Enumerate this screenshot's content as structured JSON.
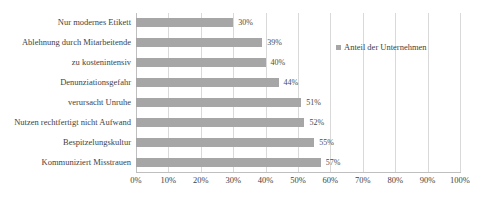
{
  "chart_data": {
    "type": "bar",
    "orientation": "horizontal",
    "title": "",
    "xlabel": "",
    "ylabel": "",
    "categories": [
      "Nur modernes Etikett",
      "Ablehnung durch Mitarbeitende",
      "zu kostenintensiv",
      "Denunziationsgefahr",
      "verursacht Unruhe",
      "Nutzen rechtfertigt nicht Aufwand",
      "Bespitzelungskultur",
      "Kommuniziert Misstrauen"
    ],
    "values": [
      30,
      39,
      40,
      44,
      51,
      52,
      55,
      57
    ],
    "value_labels": [
      "30%",
      "39%",
      "40%",
      "44%",
      "51%",
      "52%",
      "55%",
      "57%"
    ],
    "series": [
      {
        "name": "Anteil der Unternehmen",
        "values": [
          30,
          39,
          40,
          44,
          51,
          52,
          55,
          57
        ],
        "color": "#a6a6a6"
      }
    ],
    "xlim": [
      0,
      100
    ],
    "xticks": [
      0,
      10,
      20,
      30,
      40,
      50,
      60,
      70,
      80,
      90,
      100
    ],
    "xtick_labels": [
      "0%",
      "10%",
      "20%",
      "30%",
      "40%",
      "50%",
      "60%",
      "70%",
      "80%",
      "90%",
      "100%"
    ],
    "grid": true,
    "grid_axis": "x",
    "legend": {
      "position": "right",
      "entries": [
        {
          "label": "Anteil der Unternehmen",
          "color": "#a6a6a6",
          "marker": "square"
        }
      ]
    },
    "colors": {
      "bar": "#a6a6a6",
      "gridline": "#d9d9d9",
      "axis": "#bfbfbf",
      "text": "#3f3f3f",
      "background": "#ffffff"
    }
  }
}
